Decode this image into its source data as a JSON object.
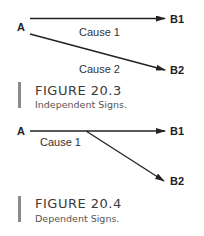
{
  "figures": [
    {
      "id": "20.3",
      "nodes": {
        "source": "A",
        "target1": "B1",
        "target2": "B2"
      },
      "edges": {
        "cause1": "Cause 1",
        "cause2": "Cause 2"
      },
      "caption": {
        "title": "FIGURE 20.3",
        "subtitle": "Independent Signs."
      }
    },
    {
      "id": "20.4",
      "nodes": {
        "source": "A",
        "target1": "B1",
        "target2": "B2"
      },
      "edges": {
        "cause1": "Cause 1"
      },
      "caption": {
        "title": "FIGURE 20.4",
        "subtitle": "Dependent Signs."
      }
    }
  ],
  "colors": {
    "line": "#222222",
    "caption_bar": "#8a8a8a",
    "caption_text": "#3a3a3a"
  }
}
